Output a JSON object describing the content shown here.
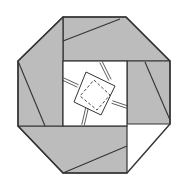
{
  "diagram": {
    "type": "origami-octagon-fold",
    "colors": {
      "background": "#ffffff",
      "paper_shade": "#bcbcbc",
      "line": "#333333",
      "inner": "#ffffff"
    },
    "octagon_points": "63,17 126,17 170,61 170,124 127,173 63,173 18,126 18,61",
    "inner_square": {
      "x": 63,
      "y": 61,
      "w": 64,
      "h": 65
    },
    "flaps": [
      {
        "name": "top-flap",
        "points": "63,17 126,17 170,61 63,61",
        "crease": "63,41 120,19"
      },
      {
        "name": "right-flap",
        "points": "127,61 170,61 170,124 127,124",
        "crease": "145,62 170,120"
      },
      {
        "name": "bottom-flap",
        "points": "18,126 127,126 127,173 63,173",
        "crease": "63,173 127,146"
      },
      {
        "name": "left-flap",
        "points": "18,61 63,17 63,126 18,126",
        "crease": "18,61 45,126"
      }
    ],
    "center_square": "86,72 115,86 101,115 74,102",
    "center_dashed_square": "94,80 110,95 97,110 80,96",
    "double_lines": [
      {
        "x1": 101,
        "y1": 62,
        "x2": 110,
        "y2": 80
      },
      {
        "x1": 127,
        "y1": 107,
        "x2": 112,
        "y2": 102
      },
      {
        "x1": 83,
        "y1": 125,
        "x2": 87,
        "y2": 108
      },
      {
        "x1": 63,
        "y1": 79,
        "x2": 78,
        "y2": 86
      }
    ]
  }
}
